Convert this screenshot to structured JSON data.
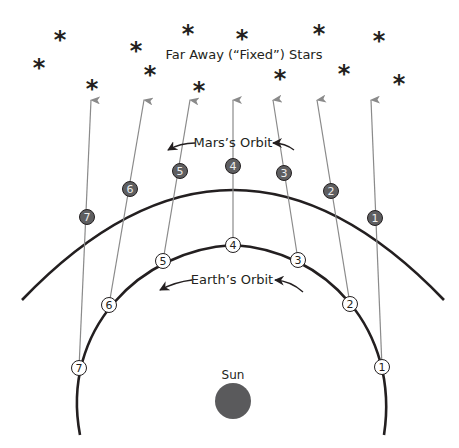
{
  "title": "Far Away (“Fixed”) Stars",
  "labels": {
    "mars_orbit": "Mars’s Orbit",
    "earth_orbit": "Earth’s Orbit",
    "sun": "Sun"
  },
  "colors": {
    "ink": "#231f20",
    "sight_line": "#8a8a8a",
    "mars_fill": "#5e5e60",
    "sun_fill": "#5a5a5c"
  },
  "stars": [
    {
      "x": 39,
      "y": 62
    },
    {
      "x": 60,
      "y": 34
    },
    {
      "x": 92,
      "y": 83
    },
    {
      "x": 136,
      "y": 45
    },
    {
      "x": 150,
      "y": 69
    },
    {
      "x": 188,
      "y": 28
    },
    {
      "x": 199,
      "y": 85
    },
    {
      "x": 242,
      "y": 33
    },
    {
      "x": 280,
      "y": 73
    },
    {
      "x": 319,
      "y": 28
    },
    {
      "x": 344,
      "y": 68
    },
    {
      "x": 379,
      "y": 35
    },
    {
      "x": 399,
      "y": 78
    }
  ],
  "mars_positions": [
    {
      "n": "1",
      "x": 375,
      "y": 218
    },
    {
      "n": "2",
      "x": 331,
      "y": 191
    },
    {
      "n": "3",
      "x": 284,
      "y": 173
    },
    {
      "n": "4",
      "x": 233,
      "y": 166
    },
    {
      "n": "5",
      "x": 180,
      "y": 171
    },
    {
      "n": "6",
      "x": 130,
      "y": 189
    },
    {
      "n": "7",
      "x": 87,
      "y": 217
    }
  ],
  "earth_positions": [
    {
      "n": "1",
      "x": 382,
      "y": 367
    },
    {
      "n": "2",
      "x": 350,
      "y": 304
    },
    {
      "n": "3",
      "x": 298,
      "y": 260
    },
    {
      "n": "4",
      "x": 233,
      "y": 245
    },
    {
      "n": "5",
      "x": 163,
      "y": 261
    },
    {
      "n": "6",
      "x": 109,
      "y": 305
    },
    {
      "n": "7",
      "x": 79,
      "y": 368
    }
  ],
  "sight_line_tips": [
    {
      "n": "1",
      "x": 371,
      "y": 100
    },
    {
      "n": "2",
      "x": 317,
      "y": 100
    },
    {
      "n": "3",
      "x": 273,
      "y": 100
    },
    {
      "n": "4",
      "x": 233,
      "y": 100
    },
    {
      "n": "5",
      "x": 190,
      "y": 100
    },
    {
      "n": "6",
      "x": 144,
      "y": 100
    },
    {
      "n": "7",
      "x": 91,
      "y": 100
    }
  ]
}
